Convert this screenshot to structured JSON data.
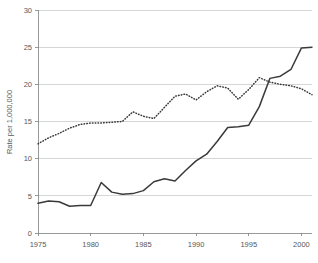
{
  "chart_data": {
    "type": "line",
    "title": "",
    "subtitle": "",
    "xlabel": "",
    "ylabel": "Rate per 1,000,000",
    "xlim": [
      1975,
      2001
    ],
    "ylim": [
      0,
      30
    ],
    "grid": true,
    "legend": "none",
    "x_ticks": [
      "1975",
      "1980",
      "1985",
      "1990",
      "1995",
      "2000"
    ],
    "x_tick_values": [
      1975,
      1980,
      1985,
      1990,
      1995,
      2000
    ],
    "y_ticks": [
      "0",
      "5",
      "10",
      "15",
      "20",
      "25",
      "30"
    ],
    "y_tick_values": [
      0,
      5,
      10,
      15,
      20,
      25,
      30
    ],
    "x": [
      1975,
      1976,
      1977,
      1978,
      1979,
      1980,
      1981,
      1982,
      1983,
      1984,
      1985,
      1986,
      1987,
      1988,
      1989,
      1990,
      1991,
      1992,
      1993,
      1994,
      1995,
      1996,
      1997,
      1998,
      1999,
      2000,
      2001
    ],
    "series": [
      {
        "name": "solid-series",
        "style": "solid",
        "values": [
          4.0,
          4.3,
          4.2,
          3.6,
          3.7,
          3.7,
          6.8,
          5.5,
          5.2,
          5.3,
          5.7,
          6.9,
          7.3,
          7.0,
          8.4,
          9.7,
          10.6,
          12.3,
          14.2,
          14.3,
          14.5,
          17.0,
          20.8,
          21.1,
          22.0,
          24.9,
          25.0
        ]
      },
      {
        "name": "dotted-series",
        "style": "dotted",
        "values": [
          12.0,
          12.8,
          13.4,
          14.1,
          14.6,
          14.8,
          14.8,
          14.9,
          15.0,
          16.3,
          15.7,
          15.4,
          16.9,
          18.4,
          18.7,
          17.9,
          19.0,
          19.8,
          19.5,
          18.0,
          19.3,
          20.9,
          20.3,
          20.0,
          19.8,
          19.4,
          18.6
        ]
      }
    ]
  },
  "plot": {
    "left": 38,
    "right": 312,
    "top": 10,
    "bottom": 233
  }
}
